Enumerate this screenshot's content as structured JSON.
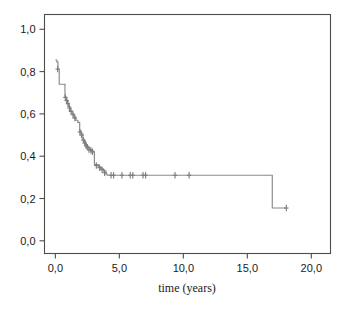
{
  "figure": {
    "background_color": "#ffffff",
    "frame_color": "#4d4d4d",
    "curve_color": "#8a8a8a"
  },
  "axis": {
    "x_title": "time (years)",
    "y_title": "",
    "x_tick_labels": [
      "0,0",
      "5,0",
      "10,0",
      "15,0",
      "20,0"
    ],
    "y_tick_labels": [
      "0,0",
      "0,2",
      "0,4",
      "0,6",
      "0,8",
      "1,0"
    ]
  },
  "chart_data": {
    "type": "line",
    "title": "",
    "subtitle": "",
    "xlabel": "time (years)",
    "ylabel": "",
    "xlim": [
      -0.85,
      21.5
    ],
    "ylim": [
      -0.06,
      1.07
    ],
    "xticks": [
      0,
      5,
      10,
      15,
      20
    ],
    "xticklabels": [
      "0,0",
      "5,0",
      "10,0",
      "15,0",
      "20,0"
    ],
    "yticks": [
      0.0,
      0.2,
      0.4,
      0.6,
      0.8,
      1.0
    ],
    "yticklabels": [
      "0,0",
      "0,2",
      "0,4",
      "0,6",
      "0,8",
      "1,0"
    ],
    "grid": false,
    "legend": null,
    "decimal_separator": "comma",
    "series": [
      {
        "name": "survival",
        "step": "post",
        "x": [
          0.0,
          0.12,
          0.2,
          0.3,
          0.75,
          0.85,
          0.95,
          1.05,
          1.15,
          1.3,
          1.45,
          1.6,
          1.75,
          1.9,
          2.0,
          2.15,
          2.25,
          2.35,
          2.45,
          2.55,
          2.7,
          2.85,
          2.95,
          3.05,
          3.35,
          3.55,
          3.75,
          3.95,
          4.05,
          16.95,
          18.1
        ],
        "y": [
          0.855,
          0.845,
          0.81,
          0.74,
          0.68,
          0.665,
          0.65,
          0.635,
          0.615,
          0.6,
          0.585,
          0.57,
          0.56,
          0.52,
          0.505,
          0.48,
          0.47,
          0.455,
          0.445,
          0.44,
          0.43,
          0.425,
          0.42,
          0.36,
          0.35,
          0.34,
          0.33,
          0.315,
          0.31,
          0.155,
          0.155
        ]
      }
    ],
    "censoring_marks": {
      "symbol": "plus",
      "points": [
        {
          "x": 0.18,
          "y": 0.812
        },
        {
          "x": 0.78,
          "y": 0.678
        },
        {
          "x": 0.88,
          "y": 0.663
        },
        {
          "x": 0.98,
          "y": 0.648
        },
        {
          "x": 1.1,
          "y": 0.628
        },
        {
          "x": 1.22,
          "y": 0.612
        },
        {
          "x": 1.38,
          "y": 0.596
        },
        {
          "x": 1.52,
          "y": 0.58
        },
        {
          "x": 1.92,
          "y": 0.514
        },
        {
          "x": 2.05,
          "y": 0.5
        },
        {
          "x": 2.18,
          "y": 0.476
        },
        {
          "x": 2.3,
          "y": 0.462
        },
        {
          "x": 2.4,
          "y": 0.45
        },
        {
          "x": 2.5,
          "y": 0.442
        },
        {
          "x": 2.62,
          "y": 0.432
        },
        {
          "x": 2.78,
          "y": 0.427
        },
        {
          "x": 2.9,
          "y": 0.421
        },
        {
          "x": 3.2,
          "y": 0.356
        },
        {
          "x": 3.45,
          "y": 0.346
        },
        {
          "x": 3.65,
          "y": 0.336
        },
        {
          "x": 3.85,
          "y": 0.322
        },
        {
          "x": 4.35,
          "y": 0.31
        },
        {
          "x": 4.55,
          "y": 0.31
        },
        {
          "x": 5.2,
          "y": 0.31
        },
        {
          "x": 5.85,
          "y": 0.31
        },
        {
          "x": 6.05,
          "y": 0.31
        },
        {
          "x": 6.85,
          "y": 0.31
        },
        {
          "x": 7.05,
          "y": 0.31
        },
        {
          "x": 9.35,
          "y": 0.31
        },
        {
          "x": 10.45,
          "y": 0.31
        },
        {
          "x": 18.05,
          "y": 0.155
        }
      ]
    }
  }
}
